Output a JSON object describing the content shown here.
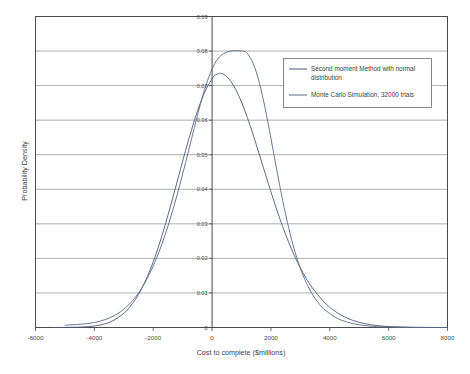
{
  "chart_data": {
    "type": "line",
    "title": "",
    "xlabel": "Cost to complete ($millions)",
    "ylabel": "Probability Density",
    "xlim": [
      -6000,
      8000
    ],
    "ylim": [
      0,
      0.09
    ],
    "grid": true,
    "legend_position": "top-right",
    "xticks": [
      "-6000",
      "-4000",
      "-2000",
      "0",
      "2000",
      "4000",
      "6000",
      "8000"
    ],
    "xtick_values": [
      -6000,
      -4000,
      -2000,
      0,
      2000,
      4000,
      6000,
      8000
    ],
    "yticks": [
      "0",
      "0.01",
      "0.02",
      "0.03",
      "0.04",
      "0.05",
      "0.06",
      "0.07",
      "0.08",
      "0.09"
    ],
    "ytick_values": [
      0,
      0.01,
      0.02,
      0.03,
      0.04,
      0.05,
      0.06,
      0.07,
      0.08,
      0.09
    ],
    "series": [
      {
        "name": "Second moment Method with normal distribution",
        "color": "#4a5a7a",
        "mean": 250,
        "sigma": 1450,
        "x": [
          -5400,
          -5000,
          -4600,
          -4200,
          -3800,
          -3400,
          -3000,
          -2800,
          -2600,
          -2400,
          -2200,
          -2000,
          -1800,
          -1600,
          -1400,
          -1200,
          -1000,
          -800,
          -600,
          -400,
          -200,
          0,
          100,
          250,
          400,
          600,
          800,
          1000,
          1200,
          1400,
          1600,
          1800,
          2000,
          2200,
          2400,
          2600,
          2800,
          3000,
          3200,
          3400,
          3800,
          4200,
          4600,
          5000,
          5400,
          5800,
          6200,
          7000,
          8000
        ],
        "values": [
          0.0,
          1e-05,
          3e-05,
          0.0001,
          0.00028,
          0.00071,
          0.0016,
          0.0023,
          0.0032,
          0.00435,
          0.00575,
          0.00742,
          0.00935,
          0.01152,
          0.01387,
          0.01632,
          0.0188,
          0.0212,
          0.02342,
          0.02537,
          0.02695,
          0.0281,
          0.02851,
          0.02873,
          0.02862,
          0.028,
          0.02693,
          0.02548,
          0.02372,
          0.02174,
          0.01963,
          0.01747,
          0.01534,
          0.0133,
          0.0114,
          0.00966,
          0.0081,
          0.00673,
          0.00554,
          0.00452,
          0.0029,
          0.00178,
          0.00104,
          0.00058,
          0.00031,
          0.00016,
          8e-05,
          1e-05,
          0.0
        ]
      },
      {
        "name": "Monte Carlo Simulation, 32000 trials",
        "color": "#5a6a85",
        "x": [
          -5000,
          -4800,
          -4600,
          -4400,
          -4200,
          -4000,
          -3800,
          -3600,
          -3400,
          -3200,
          -3000,
          -2800,
          -2600,
          -2400,
          -2200,
          -2000,
          -1800,
          -1600,
          -1400,
          -1200,
          -1000,
          -800,
          -600,
          -400,
          -200,
          0,
          200,
          400,
          600,
          800,
          1000,
          1100,
          1200,
          1400,
          1600,
          1800,
          2000,
          2200,
          2400,
          2600,
          2800,
          3000,
          3200,
          3400,
          3600,
          3800,
          4200,
          4600,
          5000,
          5400,
          5800,
          6400,
          7200,
          8000
        ],
        "values": [
          0.0003,
          0.00034,
          0.00038,
          0.00044,
          0.00052,
          0.00064,
          0.00082,
          0.00106,
          0.00138,
          0.0018,
          0.00235,
          0.00305,
          0.00392,
          0.005,
          0.00632,
          0.0079,
          0.00974,
          0.01186,
          0.01424,
          0.01687,
          0.0197,
          0.02268,
          0.0257,
          0.02862,
          0.0312,
          0.0332,
          0.03452,
          0.03518,
          0.03548,
          0.03556,
          0.0355,
          0.03545,
          0.0352,
          0.0339,
          0.0315,
          0.0282,
          0.0243,
          0.0202,
          0.0163,
          0.01285,
          0.00995,
          0.0076,
          0.00576,
          0.00432,
          0.00322,
          0.00238,
          0.00128,
          0.00068,
          0.00035,
          0.00017,
          8e-05,
          3e-05,
          1e-05,
          0.0
        ]
      }
    ],
    "note_series_scaling": "Second moment curve drawn at 2.56x listed density, Monte Carlo at 2.25x, matching rendered peak heights 0.0735 and 0.0800"
  },
  "legend": {
    "entries": [
      {
        "label": "Second moment Method with normal distribution"
      },
      {
        "label": "Monte Carlo Simulation, 32000 trials"
      }
    ]
  },
  "axes": {
    "x_title": "Cost to complete ($millions)",
    "y_title": "Probability Density"
  },
  "colors": {
    "series_one": "#4a5a7a",
    "series_two": "#5a6a85",
    "grid": "#8c8c8c",
    "axis": "#4a4a4a",
    "background": "#ffffff"
  }
}
